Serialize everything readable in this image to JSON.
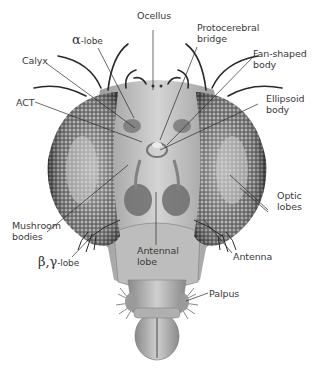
{
  "figure": {
    "labels": {
      "ocellus": "Ocellus",
      "protocerebral_bridge_1": "Protocerebral",
      "protocerebral_bridge_2": "bridge",
      "alpha_lobe_greek": "α",
      "alpha_lobe_suffix": "-lobe",
      "calyx": "Calyx",
      "fan_shaped_body_1": "Fan-shaped",
      "fan_shaped_body_2": "body",
      "act": "ACT",
      "ellipsoid_body_1": "Ellipsoid",
      "ellipsoid_body_2": "body",
      "optic_lobes_1": "Optic",
      "optic_lobes_2": "lobes",
      "mushroom_bodies_1": "Mushroom",
      "mushroom_bodies_2": "bodies",
      "beta_gamma_greek": "β,γ",
      "beta_gamma_suffix": "-lobe",
      "antennal_lobe_1": "Antennal",
      "antennal_lobe_2": "lobe",
      "antenna": "Antenna",
      "palpus": "Palpus"
    },
    "colors": {
      "background": "#ffffff",
      "text": "#3a3a3a",
      "leader_line": "#2a2a2a",
      "eye_dark": "#3c3c3c",
      "eye_light": "#bdbdbd",
      "head": "#b8b8b8"
    }
  }
}
